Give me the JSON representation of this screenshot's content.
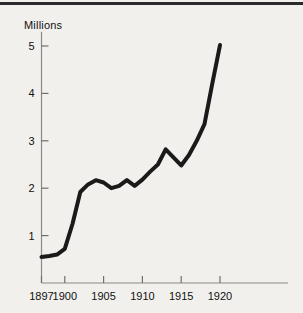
{
  "figure": {
    "background_color": "#f2f0ec",
    "ink_color": "#1a1a1a",
    "top_rule": "horizontal-rule"
  },
  "chart_data": {
    "type": "line",
    "title": "",
    "subtitle": "",
    "xlabel": "",
    "ylabel": "Millions",
    "ylabel_position": "top-left",
    "grid": false,
    "legend": "none",
    "xlim": [
      1897,
      1920
    ],
    "ylim": [
      0,
      5.3
    ],
    "x_ticks": [
      1897,
      1900,
      1905,
      1910,
      1915,
      1920
    ],
    "x_tick_labels": [
      "1897",
      "1900",
      "1905",
      "1910",
      "1915",
      "1920"
    ],
    "y_ticks": [
      1,
      2,
      3,
      4,
      5
    ],
    "y_tick_labels": [
      "1",
      "2",
      "3",
      "4",
      "5"
    ],
    "units": "Millions",
    "series": [
      {
        "name": "value",
        "x": [
          1897,
          1898,
          1899,
          1900,
          1901,
          1902,
          1903,
          1904,
          1905,
          1906,
          1907,
          1908,
          1909,
          1910,
          1911,
          1912,
          1913,
          1914,
          1915,
          1916,
          1917,
          1918,
          1919,
          1920
        ],
        "values": [
          0.55,
          0.57,
          0.6,
          0.72,
          1.25,
          1.92,
          2.08,
          2.17,
          2.12,
          2.0,
          2.05,
          2.17,
          2.05,
          2.18,
          2.35,
          2.5,
          2.82,
          2.65,
          2.48,
          2.7,
          3.0,
          3.35,
          4.2,
          5.02
        ]
      }
    ]
  }
}
